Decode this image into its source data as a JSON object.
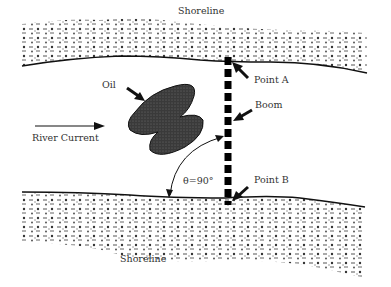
{
  "labels": {
    "shoreline_top": "Shoreline",
    "shoreline_bottom": "Shoreline",
    "point_a": "Point A",
    "point_b": "Point B",
    "oil": "Oil",
    "boom": "Boom",
    "river_current": "River Current",
    "angle": "θ=90°"
  },
  "colors": {
    "ink": "#111111",
    "text": "#333333",
    "oil_fill": "#3a3a3a",
    "background": "#ffffff"
  }
}
